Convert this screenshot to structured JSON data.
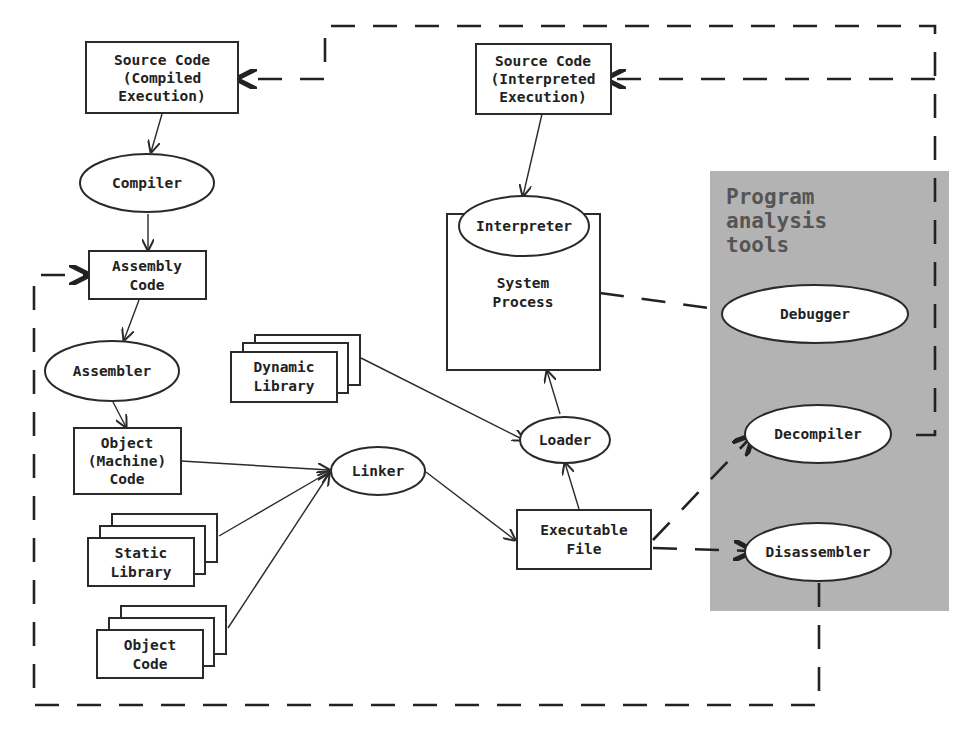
{
  "diagram": {
    "panel": {
      "title_lines": [
        "Program",
        "analysis",
        "tools"
      ],
      "color": "#b3b3b3"
    },
    "nodes": {
      "src_compiled": {
        "lines": [
          "Source Code",
          "(Compiled",
          "Execution)"
        ],
        "shape": "rect"
      },
      "compiler": {
        "lines": [
          "Compiler"
        ],
        "shape": "ellipse"
      },
      "assembly": {
        "lines": [
          "Assembly",
          "Code"
        ],
        "shape": "rect"
      },
      "assembler": {
        "lines": [
          "Assembler"
        ],
        "shape": "ellipse"
      },
      "object_machine": {
        "lines": [
          "Object",
          "(Machine)",
          "Code"
        ],
        "shape": "rect"
      },
      "static_lib": {
        "lines": [
          "Static",
          "Library"
        ],
        "shape": "stacked-rect"
      },
      "object_code": {
        "lines": [
          "Object",
          "Code"
        ],
        "shape": "stacked-rect"
      },
      "dynamic_lib": {
        "lines": [
          "Dynamic",
          "Library"
        ],
        "shape": "stacked-rect"
      },
      "linker": {
        "lines": [
          "Linker"
        ],
        "shape": "ellipse"
      },
      "executable": {
        "lines": [
          "Executable",
          "File"
        ],
        "shape": "rect"
      },
      "loader": {
        "lines": [
          "Loader"
        ],
        "shape": "ellipse"
      },
      "src_interpreted": {
        "lines": [
          "Source Code",
          "(Interpreted",
          "Execution)"
        ],
        "shape": "rect"
      },
      "interpreter": {
        "lines": [
          "Interpreter"
        ],
        "shape": "ellipse"
      },
      "system_process": {
        "lines": [
          "System",
          "Process"
        ],
        "shape": "rect"
      },
      "debugger": {
        "lines": [
          "Debugger"
        ],
        "shape": "ellipse"
      },
      "decompiler": {
        "lines": [
          "Decompiler"
        ],
        "shape": "ellipse"
      },
      "disassembler": {
        "lines": [
          "Disassembler"
        ],
        "shape": "ellipse"
      }
    },
    "edges": [
      {
        "from": "Source Code (Compiled Execution)",
        "to": "Compiler",
        "style": "solid"
      },
      {
        "from": "Compiler",
        "to": "Assembly Code",
        "style": "solid"
      },
      {
        "from": "Assembly Code",
        "to": "Assembler",
        "style": "solid"
      },
      {
        "from": "Assembler",
        "to": "Object (Machine) Code",
        "style": "solid"
      },
      {
        "from": "Object (Machine) Code",
        "to": "Linker",
        "style": "solid"
      },
      {
        "from": "Static Library",
        "to": "Linker",
        "style": "solid"
      },
      {
        "from": "Object Code",
        "to": "Linker",
        "style": "solid"
      },
      {
        "from": "Linker",
        "to": "Executable File",
        "style": "solid"
      },
      {
        "from": "Executable File",
        "to": "Loader",
        "style": "solid"
      },
      {
        "from": "Dynamic Library",
        "to": "Loader",
        "style": "solid"
      },
      {
        "from": "Loader",
        "to": "System Process",
        "style": "solid"
      },
      {
        "from": "Source Code (Interpreted Execution)",
        "to": "Interpreter",
        "style": "solid"
      },
      {
        "from": "System Process",
        "to": "Debugger",
        "style": "dashed"
      },
      {
        "from": "Executable File",
        "to": "Decompiler",
        "style": "dashed"
      },
      {
        "from": "Executable File",
        "to": "Disassembler",
        "style": "dashed"
      },
      {
        "from": "Decompiler",
        "to": "Source Code (Interpreted Execution)",
        "style": "dashed"
      },
      {
        "from": "Decompiler",
        "to": "Source Code (Compiled Execution)",
        "style": "dashed"
      },
      {
        "from": "Disassembler",
        "to": "Assembly Code",
        "style": "dashed"
      }
    ]
  }
}
